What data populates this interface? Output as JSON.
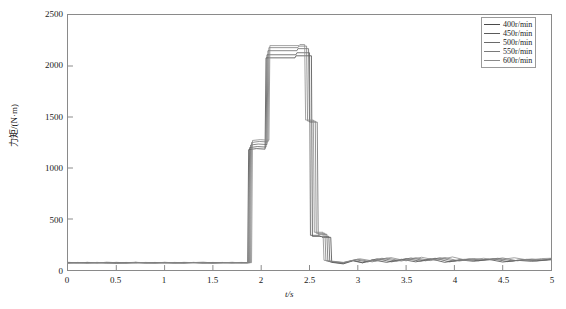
{
  "chart_data": {
    "type": "line",
    "title": "",
    "xlabel": "t/s",
    "ylabel": "力矩/(N·m)",
    "xlim": [
      0,
      5
    ],
    "ylim": [
      0,
      2500
    ],
    "xticks": [
      "0",
      "0.5",
      "1",
      "1.5",
      "2",
      "2.5",
      "3",
      "3.5",
      "4",
      "4.5",
      "5"
    ],
    "xtick_values": [
      0,
      0.5,
      1,
      1.5,
      2,
      2.5,
      3,
      3.5,
      4,
      4.5,
      5
    ],
    "yticks": [
      "0",
      "500",
      "1000",
      "1500",
      "2000",
      "2500"
    ],
    "ytick_values": [
      0,
      500,
      1000,
      1500,
      2000,
      2500
    ],
    "grid": false,
    "legend_position": "top-right",
    "series": [
      {
        "name": "400r/min",
        "color": "#4a4a4a",
        "x": [
          0.0,
          0.1,
          0.2,
          0.3,
          0.4,
          0.5,
          0.6,
          0.7,
          0.8,
          0.9,
          1.0,
          1.1,
          1.2,
          1.3,
          1.4,
          1.5,
          1.6,
          1.7,
          1.8,
          1.86,
          1.87,
          1.95,
          2.04,
          2.05,
          2.35,
          2.36,
          2.52,
          2.53,
          2.62,
          2.63,
          2.72,
          2.73,
          2.85,
          2.95,
          3.05,
          3.15,
          3.3,
          3.45,
          3.6,
          3.75,
          3.9,
          4.05,
          4.2,
          4.35,
          4.5,
          4.65,
          4.8,
          5.0
        ],
        "y": [
          70,
          72,
          68,
          74,
          70,
          66,
          72,
          75,
          68,
          70,
          73,
          69,
          71,
          74,
          70,
          68,
          72,
          70,
          71,
          70,
          1180,
          1190,
          1185,
          2080,
          2080,
          2100,
          2100,
          330,
          330,
          320,
          320,
          75,
          60,
          90,
          70,
          100,
          75,
          105,
          80,
          110,
          75,
          100,
          85,
          105,
          78,
          95,
          85,
          100
        ]
      },
      {
        "name": "450r/min",
        "color": "#5a5a5a",
        "x": [
          0.0,
          0.1,
          0.2,
          0.3,
          0.4,
          0.5,
          0.6,
          0.7,
          0.8,
          0.9,
          1.0,
          1.1,
          1.2,
          1.3,
          1.4,
          1.5,
          1.6,
          1.7,
          1.8,
          1.87,
          1.88,
          1.96,
          2.05,
          2.06,
          2.36,
          2.37,
          2.5,
          2.51,
          2.6,
          2.61,
          2.7,
          2.71,
          2.85,
          2.95,
          3.05,
          3.2,
          3.35,
          3.5,
          3.65,
          3.8,
          3.95,
          4.1,
          4.25,
          4.4,
          4.55,
          4.7,
          4.85,
          5.0
        ],
        "y": [
          75,
          70,
          74,
          68,
          76,
          72,
          68,
          74,
          72,
          69,
          75,
          71,
          68,
          73,
          76,
          70,
          72,
          74,
          70,
          72,
          1200,
          1210,
          1205,
          2110,
          2110,
          2130,
          2130,
          340,
          340,
          330,
          330,
          80,
          65,
          95,
          72,
          110,
          80,
          112,
          85,
          115,
          80,
          105,
          90,
          110,
          82,
          100,
          90,
          105
        ]
      },
      {
        "name": "500r/min",
        "color": "#6a6a6a",
        "x": [
          0.0,
          0.1,
          0.2,
          0.3,
          0.4,
          0.5,
          0.6,
          0.7,
          0.8,
          0.9,
          1.0,
          1.1,
          1.2,
          1.3,
          1.4,
          1.5,
          1.6,
          1.7,
          1.8,
          1.88,
          1.89,
          1.97,
          2.06,
          2.07,
          2.37,
          2.38,
          2.49,
          2.5,
          2.58,
          2.59,
          2.68,
          2.69,
          2.85,
          2.98,
          3.1,
          3.25,
          3.4,
          3.55,
          3.7,
          3.85,
          4.0,
          4.15,
          4.3,
          4.45,
          4.6,
          4.75,
          4.9,
          5.0
        ],
        "y": [
          68,
          74,
          70,
          72,
          68,
          75,
          70,
          68,
          74,
          72,
          68,
          74,
          72,
          70,
          68,
          74,
          70,
          72,
          74,
          70,
          1225,
          1235,
          1230,
          2150,
          2150,
          2170,
          2170,
          1450,
          1450,
          350,
          350,
          85,
          70,
          100,
          78,
          115,
          85,
          118,
          90,
          120,
          85,
          110,
          95,
          115,
          88,
          105,
          95,
          110
        ]
      },
      {
        "name": "550r/min",
        "color": "#7a7a7a",
        "x": [
          0.0,
          0.1,
          0.2,
          0.3,
          0.4,
          0.5,
          0.6,
          0.7,
          0.8,
          0.9,
          1.0,
          1.1,
          1.2,
          1.3,
          1.4,
          1.5,
          1.6,
          1.7,
          1.8,
          1.89,
          1.9,
          1.98,
          2.07,
          2.08,
          2.38,
          2.39,
          2.47,
          2.48,
          2.56,
          2.57,
          2.66,
          2.67,
          2.85,
          3.0,
          3.15,
          3.3,
          3.45,
          3.6,
          3.75,
          3.9,
          4.05,
          4.2,
          4.35,
          4.5,
          4.65,
          4.8,
          4.95,
          5.0
        ],
        "y": [
          72,
          68,
          75,
          70,
          72,
          68,
          74,
          71,
          70,
          74,
          70,
          68,
          75,
          72,
          70,
          71,
          74,
          68,
          72,
          74,
          1250,
          1260,
          1255,
          2180,
          2180,
          2195,
          2195,
          1460,
          1460,
          360,
          360,
          90,
          72,
          105,
          80,
          118,
          88,
          120,
          92,
          122,
          88,
          112,
          98,
          118,
          90,
          108,
          98,
          112
        ]
      },
      {
        "name": "600r/min",
        "color": "#8a8a8a",
        "x": [
          0.0,
          0.1,
          0.2,
          0.3,
          0.4,
          0.5,
          0.6,
          0.7,
          0.8,
          0.9,
          1.0,
          1.1,
          1.2,
          1.3,
          1.4,
          1.5,
          1.6,
          1.7,
          1.8,
          1.9,
          1.91,
          1.99,
          2.08,
          2.09,
          2.39,
          2.4,
          2.45,
          2.46,
          2.54,
          2.55,
          2.64,
          2.65,
          2.85,
          3.02,
          3.18,
          3.34,
          3.5,
          3.66,
          3.82,
          3.98,
          4.14,
          4.3,
          4.46,
          4.62,
          4.78,
          4.9,
          5.0
        ],
        "y": [
          70,
          72,
          68,
          74,
          71,
          70,
          68,
          75,
          72,
          68,
          74,
          72,
          69,
          74,
          72,
          68,
          71,
          75,
          70,
          72,
          1270,
          1278,
          1272,
          2200,
          2200,
          2210,
          2210,
          1470,
          1470,
          370,
          370,
          95,
          75,
          110,
          85,
          122,
          90,
          125,
          95,
          128,
          92,
          115,
          100,
          120,
          95,
          112,
          115
        ]
      }
    ],
    "legend": [
      "400r/min",
      "450r/min",
      "500r/min",
      "550r/min",
      "600r/min"
    ]
  },
  "colors": {
    "axis": "#8a8a8a",
    "text": "#1a1a1a",
    "background": "#ffffff",
    "legend_border": "#9a9a9a"
  }
}
